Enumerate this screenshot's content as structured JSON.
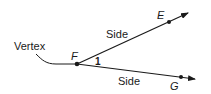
{
  "diagram": {
    "type": "angle",
    "labels": {
      "vertex_caption": "Vertex",
      "vertex_point": "F",
      "point_upper": "E",
      "point_lower": "G",
      "side_upper": "Side",
      "side_lower": "Side",
      "angle_number": "1"
    },
    "colors": {
      "stroke": "#1a1a1a",
      "background": "#ffffff"
    }
  }
}
